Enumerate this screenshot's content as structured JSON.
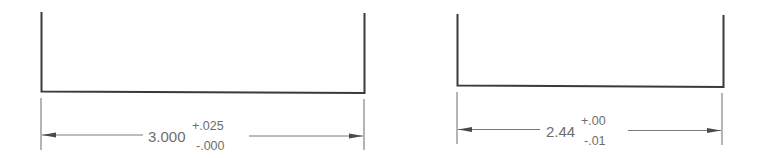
{
  "dimensions": [
    {
      "id": "left",
      "nominal": "3.000",
      "upper_tolerance": "+.025",
      "lower_tolerance": "-.000"
    },
    {
      "id": "right",
      "nominal": "2.44",
      "upper_tolerance": "+.00",
      "lower_tolerance": "-.01"
    }
  ],
  "colors": {
    "part_line": "#3a3a3a",
    "dimension_line": "#7a7a7a",
    "text": "#6e6e6e",
    "background": "#ffffff"
  }
}
